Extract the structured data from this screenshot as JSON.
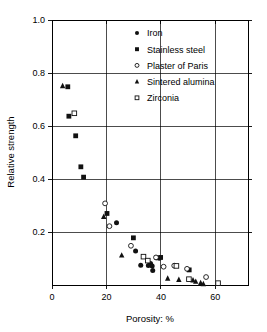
{
  "chart_data": {
    "type": "scatter",
    "title": "",
    "xlabel": "Porosity: %",
    "ylabel": "Relative strength",
    "xlim": [
      0,
      72
    ],
    "ylim": [
      0,
      1.0
    ],
    "xticks": [
      0,
      20,
      40,
      60
    ],
    "yticks": [
      0.2,
      0.4,
      0.6,
      0.8,
      1.0
    ],
    "xtick_labels": [
      "0",
      "20",
      "40",
      "60"
    ],
    "ytick_labels": [
      "0.2",
      "0.4",
      "0.6",
      "0.8",
      "1.0"
    ],
    "grid": "horizontal-and-vertical",
    "legend_position": "top-right-inside",
    "series": [
      {
        "name": "Iron",
        "marker": "filled-circle",
        "color": "#111111",
        "points": [
          [
            23.7,
            0.235
          ],
          [
            30.7,
            0.128
          ],
          [
            32.6,
            0.075
          ],
          [
            35.4,
            0.074
          ],
          [
            36.2,
            0.081
          ],
          [
            36.8,
            0.072
          ],
          [
            37.0,
            0.055
          ],
          [
            38.4,
            0.103
          ],
          [
            39.4,
            0.101
          ]
        ]
      },
      {
        "name": "Stainless steel",
        "marker": "filled-square",
        "color": "#111111",
        "points": [
          [
            5.8,
            0.748
          ],
          [
            6.2,
            0.637
          ],
          [
            8.7,
            0.563
          ],
          [
            10.6,
            0.446
          ],
          [
            11.6,
            0.407
          ],
          [
            20.2,
            0.27
          ],
          [
            29.9,
            0.178
          ],
          [
            39.9,
            0.104
          ],
          [
            50.4,
            0.057
          ]
        ]
      },
      {
        "name": "Plaster of Paris",
        "marker": "open-circle",
        "color": "#111111",
        "points": [
          [
            19.5,
            0.308
          ],
          [
            21.1,
            0.222
          ],
          [
            29.0,
            0.148
          ],
          [
            38.2,
            0.104
          ],
          [
            41.0,
            0.069
          ],
          [
            44.9,
            0.073
          ],
          [
            49.6,
            0.061
          ],
          [
            56.6,
            0.03
          ]
        ]
      },
      {
        "name": "Sintered alumina",
        "marker": "filled-triangle",
        "color": "#111111",
        "points": [
          [
            3.9,
            0.751
          ],
          [
            19.0,
            0.258
          ],
          [
            25.6,
            0.112
          ],
          [
            42.5,
            0.025
          ],
          [
            46.6,
            0.02
          ],
          [
            51.8,
            0.018
          ],
          [
            52.8,
            0.013
          ],
          [
            54.6,
            0.008
          ],
          [
            55.6,
            0.004
          ]
        ]
      },
      {
        "name": "Zirconia",
        "marker": "open-square",
        "color": "#111111",
        "points": [
          [
            8.2,
            0.648
          ],
          [
            33.6,
            0.107
          ],
          [
            35.2,
            0.092
          ],
          [
            45.7,
            0.072
          ],
          [
            50.3,
            0.022
          ],
          [
            61.0,
            0.007
          ]
        ]
      }
    ]
  },
  "axes": {
    "ylabel": "Relative strength",
    "xlabel": "Porosity: %"
  },
  "legend": {
    "items": [
      {
        "label": "Iron",
        "marker": "filled-circle"
      },
      {
        "label": "Stainless steel",
        "marker": "filled-square"
      },
      {
        "label": "Plaster of Paris",
        "marker": "open-circle"
      },
      {
        "label": "Sintered alumina",
        "marker": "filled-triangle"
      },
      {
        "label": "Zirconia",
        "marker": "open-square"
      }
    ]
  }
}
